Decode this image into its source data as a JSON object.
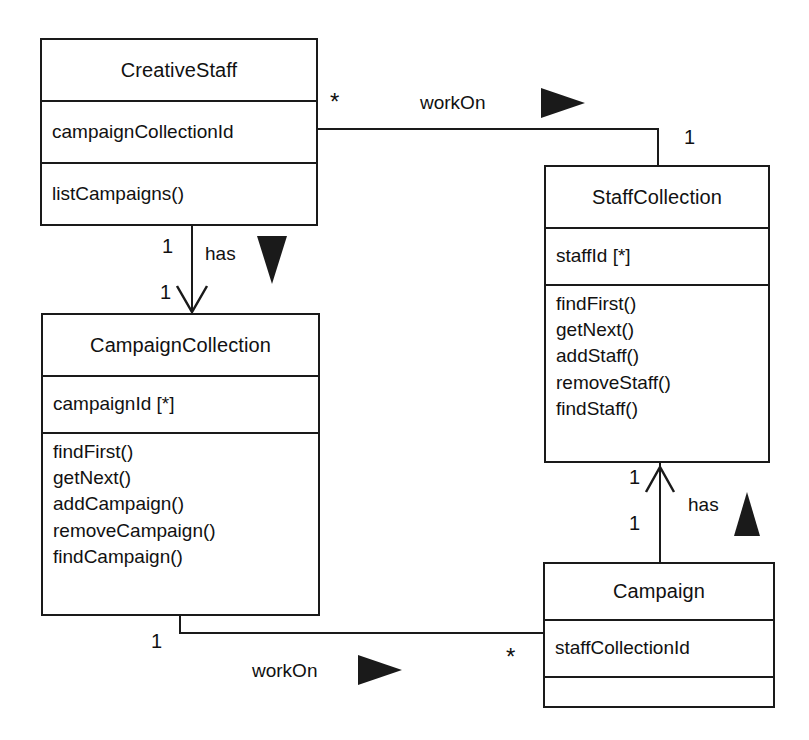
{
  "diagram": {
    "type": "uml-class-diagram",
    "title": "",
    "background": "#ffffff",
    "line_color": "#1a1a1a"
  },
  "classes": [
    {
      "id": "creative-staff",
      "name": "CreativeStaff",
      "attributes": [
        "campaignCollectionId"
      ],
      "operations": [
        "listCampaigns()"
      ]
    },
    {
      "id": "staff-collection",
      "name": "StaffCollection",
      "attributes": [
        "staffId [*]"
      ],
      "operations": [
        "findFirst()",
        "getNext()",
        "addStaff()",
        "removeStaff()",
        "findStaff()"
      ]
    },
    {
      "id": "campaign-collection",
      "name": "CampaignCollection",
      "attributes": [
        "campaignId [*]"
      ],
      "operations": [
        "findFirst()",
        "getNext()",
        "addCampaign()",
        "removeCampaign()",
        "findCampaign()"
      ]
    },
    {
      "id": "campaign",
      "name": "Campaign",
      "attributes": [
        "staffCollectionId"
      ],
      "operations": []
    }
  ],
  "associations": [
    {
      "id": "workon-top",
      "label": "workOn",
      "from": "creative-staff",
      "to": "staff-collection",
      "from_multiplicity": "*",
      "to_multiplicity": "1",
      "direction_marker": "triangle-right"
    },
    {
      "id": "has-left",
      "label": "has",
      "from": "creative-staff",
      "to": "campaign-collection",
      "from_multiplicity": "1",
      "to_multiplicity": "1",
      "direction_marker": "triangle-down"
    },
    {
      "id": "has-right",
      "label": "has",
      "from": "campaign",
      "to": "staff-collection",
      "from_multiplicity": "1",
      "to_multiplicity": "1",
      "direction_marker": "triangle-up"
    },
    {
      "id": "workon-bottom",
      "label": "workOn",
      "from": "campaign-collection",
      "to": "campaign",
      "from_multiplicity": "1",
      "to_multiplicity": "*",
      "direction_marker": "triangle-right"
    }
  ]
}
